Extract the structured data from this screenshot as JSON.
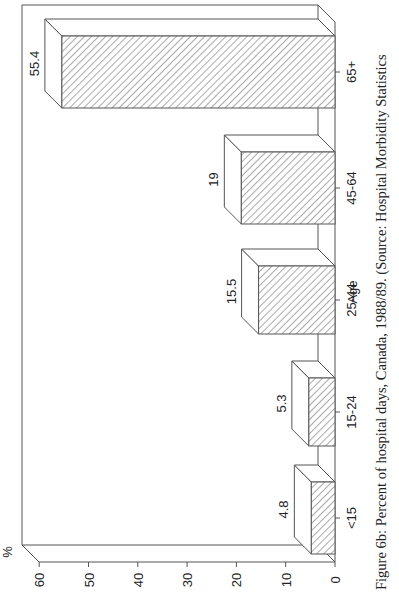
{
  "chart_data": {
    "type": "bar",
    "style": "3d-bar, hatched fill, rotated 90 degrees counterclockwise",
    "title": "",
    "caption": "Figure 6b: Percent of hospital days, Canada, 1988/89. (Source: Hospital Morbidity Statistics",
    "xlabel": "Age",
    "ylabel": "%",
    "categories": [
      "<15",
      "15-24",
      "25-44",
      "45-64",
      "65+"
    ],
    "values": [
      4.8,
      5.3,
      15.5,
      19,
      55.4
    ],
    "value_labels": [
      "4.8",
      "5.3",
      "15.5",
      "19",
      "55.4"
    ],
    "y_ticks": [
      "0",
      "10",
      "20",
      "30",
      "40",
      "50",
      "60"
    ],
    "ylim": [
      0,
      60
    ],
    "grid": false,
    "legend": null
  },
  "colors": {
    "line": "#555555",
    "hatch": "#555555",
    "background": "#ffffff"
  }
}
